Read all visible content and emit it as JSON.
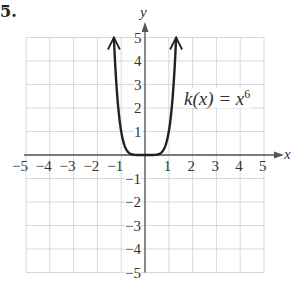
{
  "problem_label": "5.",
  "chart_data": {
    "type": "line",
    "title": "",
    "function_label": "k(x) = x⁶",
    "function_label_parts": {
      "lhs": "k(x) = x",
      "exp": "6"
    },
    "expression": "x^6",
    "xlabel": "x",
    "ylabel": "y",
    "xlim": [
      -5,
      5
    ],
    "ylim": [
      -5,
      5
    ],
    "x_ticks": [
      -5,
      -4,
      -3,
      -2,
      -1,
      1,
      2,
      3,
      4,
      5
    ],
    "y_ticks": [
      5,
      4,
      3,
      2,
      1,
      -1,
      -2,
      -3,
      -4,
      -5
    ],
    "x_tick_labels": [
      "−5",
      "−4",
      "−3",
      "−2",
      "−1",
      "1",
      "2",
      "3",
      "4",
      "5"
    ],
    "y_tick_labels": [
      "5",
      "4",
      "3",
      "2",
      "1",
      "−1",
      "−2",
      "−3",
      "−4",
      "−5"
    ],
    "grid": true,
    "series": [
      {
        "name": "k(x) = x^6",
        "x": [
          -1.31,
          -1.2,
          -1.0,
          -0.8,
          -0.6,
          -0.4,
          -0.2,
          0,
          0.2,
          0.4,
          0.6,
          0.8,
          1.0,
          1.2,
          1.31
        ],
        "y": [
          5.0,
          2.99,
          1.0,
          0.26,
          0.05,
          0.004,
          0.0,
          0,
          0.0,
          0.004,
          0.05,
          0.26,
          1.0,
          2.99,
          5.0
        ],
        "end_arrows": true
      }
    ],
    "colors": {
      "grid": "#cfcfcf",
      "axis": "#555555",
      "curve": "#222222"
    }
  }
}
